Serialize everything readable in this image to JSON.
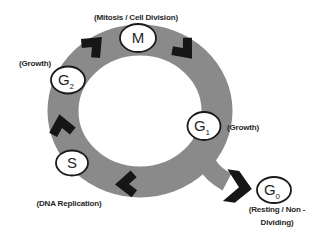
{
  "diagram": {
    "type": "cell-cycle",
    "colors": {
      "band": "#8a8a8a",
      "arrow": "#161616",
      "node_fill": "#ffffff",
      "node_outline": "#1a1a1a",
      "text": "#262626",
      "background": "#ffffff"
    },
    "phases": {
      "m": {
        "letter": "M",
        "sub": "",
        "annotation": "(Mitosis / Cell Division)"
      },
      "g2": {
        "letter": "G",
        "sub": "2",
        "annotation": "(Growth)"
      },
      "s": {
        "letter": "S",
        "sub": "",
        "annotation": "(DNA Replication)"
      },
      "g1": {
        "letter": "G",
        "sub": "1",
        "annotation": "(Growth)"
      },
      "g0": {
        "letter": "G",
        "sub": "0",
        "annotation_line1": "(Resting / Non -",
        "annotation_line2": "Dividing)"
      }
    },
    "flow_direction": "clockwise"
  }
}
